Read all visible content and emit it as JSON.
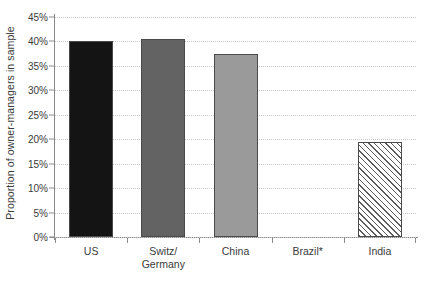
{
  "chart_data": {
    "type": "bar",
    "title": "",
    "subtitle": "",
    "xlabel": "",
    "ylabel": "Proportion of owner-managers in sample",
    "categories": [
      "US",
      "Switz/\nGermany",
      "China",
      "Brazil*",
      "India"
    ],
    "values": [
      40.0,
      40.5,
      37.5,
      0.0,
      19.5
    ],
    "ylim": [
      0,
      45
    ],
    "ytick_labels": [
      "0%",
      "5%",
      "10%",
      "15%",
      "20%",
      "25%",
      "30%",
      "35%",
      "40%",
      "45%"
    ],
    "ytick_values": [
      0,
      5,
      10,
      15,
      20,
      25,
      30,
      35,
      40,
      45
    ],
    "grid": true,
    "legend": "none",
    "bar_styles": [
      {
        "name": "US",
        "fill": "#141414",
        "pattern": "solid"
      },
      {
        "name": "Switz/Germany",
        "fill": "#636363",
        "pattern": "solid"
      },
      {
        "name": "China",
        "fill": "#9a9a9a",
        "pattern": "solid"
      },
      {
        "name": "Brazil*",
        "fill": "#ffffff",
        "pattern": "none"
      },
      {
        "name": "India",
        "fill": "#ffffff",
        "pattern": "diagonal-hatch"
      }
    ],
    "colors": {
      "axis": "#8a8a8a",
      "grid": "#c9c9c9",
      "text": "#3a3a3a",
      "background": "#ffffff"
    }
  }
}
